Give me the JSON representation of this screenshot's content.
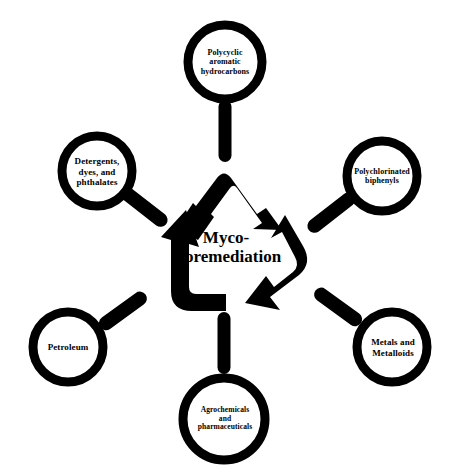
{
  "figure": {
    "background_color": "#ffffff",
    "ink_color": "#000000"
  },
  "center": {
    "label": "Myco-\nbioremediation",
    "line1": "Myco-",
    "line2": "bioremediation",
    "font_size_px": 17
  },
  "recycle_symbol": {
    "name": "recycling-arrows",
    "arrow_count": 3,
    "direction": "clockwise",
    "color": "#000000"
  },
  "magnifiers": [
    {
      "id": "polycyclic-aromatic-hydrocarbons",
      "label": "Polycyclic\naromatic\nhydrocarbons",
      "position": "top",
      "handle_direction": "down",
      "font_size_px": 8
    },
    {
      "id": "detergents-dyes-phthalates",
      "label": "Detergents,\ndyes, and\nphthalates",
      "position": "upper-left",
      "handle_direction": "down-right",
      "font_size_px": 9
    },
    {
      "id": "polychlorinated-biphenyls",
      "label": "Polychlorinated\nbiphenyls",
      "position": "upper-right",
      "handle_direction": "down-left",
      "font_size_px": 8
    },
    {
      "id": "petroleum",
      "label": "Petroleum",
      "position": "lower-left",
      "handle_direction": "up-right",
      "font_size_px": 9
    },
    {
      "id": "metals-and-metalloids",
      "label": "Metals and\nMetalloids",
      "position": "lower-right",
      "handle_direction": "up-left",
      "font_size_px": 9
    },
    {
      "id": "agrochemicals-and-pharmaceuticals",
      "label": "Agrochemicals\nand\npharmaceuticals",
      "position": "bottom",
      "handle_direction": "up",
      "font_size_px": 7.5
    }
  ]
}
